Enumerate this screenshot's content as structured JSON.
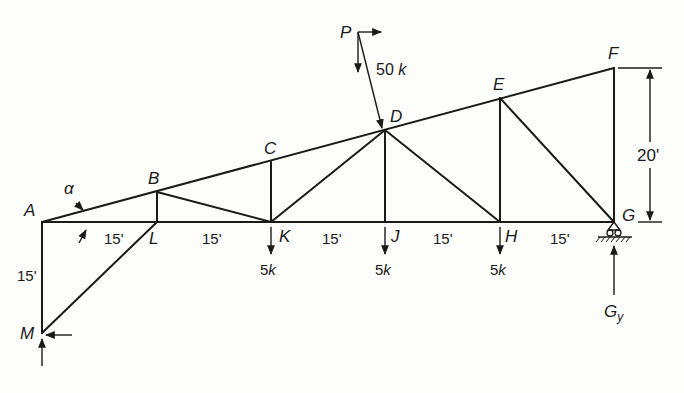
{
  "diagram": {
    "type": "truss",
    "joints": {
      "A": "A",
      "B": "B",
      "C": "C",
      "D": "D",
      "E": "E",
      "F": "F",
      "G": "G",
      "H": "H",
      "J": "J",
      "K": "K",
      "L": "L",
      "M": "M"
    },
    "angle_label": "α",
    "dimensions": {
      "panel_AL": "15'",
      "panel_LK": "15'",
      "panel_KJ": "15'",
      "panel_JH": "15'",
      "panel_HG": "15'",
      "height_AM": "15'",
      "height_FG": "20'"
    },
    "loads": {
      "P_label": "P",
      "P_value": "50",
      "P_unit": "k",
      "K_value": "5",
      "K_unit": "k",
      "J_value": "5",
      "J_unit": "k",
      "H_value": "5",
      "H_unit": "k"
    },
    "reactions": {
      "G_label": "G",
      "G_subscript": "y"
    },
    "support_G": "pin-roller",
    "colors": {
      "ink": "#1a1a1a",
      "paper": "#fdfdfb"
    }
  }
}
